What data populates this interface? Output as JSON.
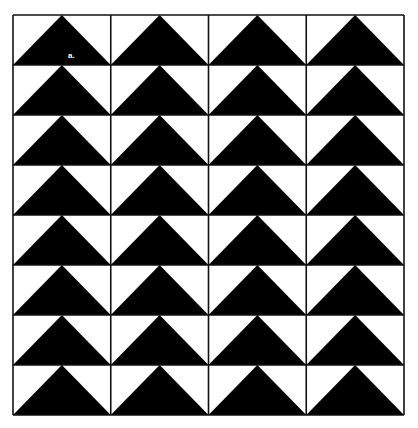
{
  "figure": {
    "type": "flying-geese-quilt-pattern",
    "label": "a.",
    "columns": 4,
    "rows": 8,
    "triangle_direction": "up",
    "colors": {
      "triangle": "#000000",
      "background": "#ffffff",
      "grid_line": "#111111"
    }
  }
}
